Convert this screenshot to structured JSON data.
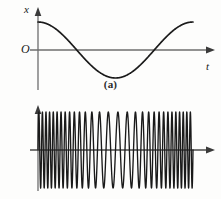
{
  "figure": {
    "background_color": "#fdfdfc",
    "axis_color": "#6e6e6e",
    "curve_color": "#1a1a1a"
  },
  "panel_a": {
    "caption": "(a)",
    "y_axis_label": "x",
    "y_axis_label_sub": "",
    "x_axis_label": "t",
    "origin_label": "O"
  },
  "panel_b": {
    "caption": "(b)",
    "y_axis_label": "u",
    "y_axis_label_sub": "s",
    "x_axis_label": "t",
    "origin_label": "O"
  },
  "chart_data": [
    {
      "type": "line",
      "id": "panel-a",
      "title": "(a)",
      "xlabel": "t",
      "ylabel": "x",
      "origin_label": "O",
      "grid": false,
      "legend": null,
      "xlim": [
        0,
        1
      ],
      "ylim": [
        -1.15,
        1.15
      ],
      "description": "Modulating signal: one full cosine cycle starting at positive maximum, dipping to minimum near the middle and returning toward maximum.",
      "waveform": {
        "function": "cosine",
        "amplitude": 1.0,
        "cycles": 1.0,
        "phase_deg": 0,
        "start_value": 1.0
      },
      "series": [
        {
          "name": "x(t)",
          "x": [
            0.0,
            0.05,
            0.1,
            0.15,
            0.2,
            0.25,
            0.3,
            0.35,
            0.4,
            0.45,
            0.5,
            0.55,
            0.6,
            0.65,
            0.7,
            0.75,
            0.8,
            0.85,
            0.9,
            0.95,
            1.0
          ],
          "values": [
            1.0,
            0.95,
            0.81,
            0.59,
            0.31,
            0.0,
            -0.31,
            -0.59,
            -0.81,
            -0.95,
            -1.0,
            -0.95,
            -0.81,
            -0.59,
            -0.31,
            0.0,
            0.31,
            0.59,
            0.81,
            0.95,
            1.0
          ]
        }
      ],
      "zero_crossings": [
        0.25,
        0.75
      ],
      "extrema": [
        {
          "x": 0.0,
          "y": 1.0,
          "kind": "maximum"
        },
        {
          "x": 0.5,
          "y": -1.0,
          "kind": "minimum"
        },
        {
          "x": 1.0,
          "y": 1.0,
          "kind": "maximum"
        }
      ]
    },
    {
      "type": "line",
      "id": "panel-b",
      "title": "(b)",
      "xlabel": "t",
      "ylabel": "u_s",
      "origin_label": "O",
      "grid": false,
      "legend": null,
      "xlim": [
        0,
        1
      ],
      "ylim": [
        -1.15,
        1.15
      ],
      "description": "Frequency-modulated carrier of constant amplitude. Instantaneous frequency follows x(t) from panel (a): densest oscillations at the start and end where x is maximum, widest spacing near the middle where x is minimum.",
      "waveform": {
        "function": "frequency-modulated-sine",
        "amplitude": 1.0,
        "carrier_cycles": 30,
        "modulation_index": 14,
        "modulating_function": "cosine",
        "modulating_cycles": 1.0,
        "constant_amplitude": true
      },
      "frequency_profile": {
        "x": [
          0.0,
          0.25,
          0.5,
          0.75,
          1.0
        ],
        "relative_frequency": [
          1.0,
          0.62,
          0.28,
          0.62,
          1.0
        ],
        "note": "high-low-high, tracking the modulating signal"
      }
    }
  ]
}
